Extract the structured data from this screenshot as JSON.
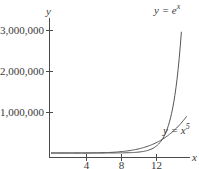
{
  "chart_data": {
    "type": "line",
    "title": "",
    "xlabel": "x",
    "ylabel": "y",
    "xlim": [
      0,
      16
    ],
    "ylim": [
      0,
      3300000
    ],
    "x_ticks": [
      4,
      8,
      12
    ],
    "x_tick_labels": [
      "4",
      "8",
      "12"
    ],
    "y_ticks": [
      1000000,
      2000000,
      3000000
    ],
    "y_tick_labels": [
      "1,000,000",
      "2,000,000",
      "3,000,000"
    ],
    "grid": false,
    "legend": "none",
    "series": [
      {
        "name": "y = e^x",
        "label_text": "y = e",
        "label_exponent": "x",
        "x": [
          0,
          2,
          4,
          6,
          8,
          10,
          11,
          12,
          13,
          14,
          14.5,
          14.9
        ],
        "values": [
          1,
          7.4,
          54.6,
          403,
          2981,
          22026,
          59874,
          162755,
          442413,
          1202604,
          1982759,
          2957929
        ]
      },
      {
        "name": "y = x^5",
        "label_text": "y = x",
        "label_exponent": "5",
        "x": [
          0,
          2,
          4,
          6,
          8,
          10,
          11,
          12,
          13,
          14,
          15,
          15.5
        ],
        "values": [
          0,
          32,
          1024,
          7776,
          32768,
          100000,
          161051,
          248832,
          371293,
          537824,
          759375,
          894661
        ]
      }
    ],
    "annotations": [
      {
        "text": "y = e^x",
        "near": "top of exponential curve"
      },
      {
        "text": "y = x^5",
        "near": "right end of power curve"
      }
    ]
  }
}
